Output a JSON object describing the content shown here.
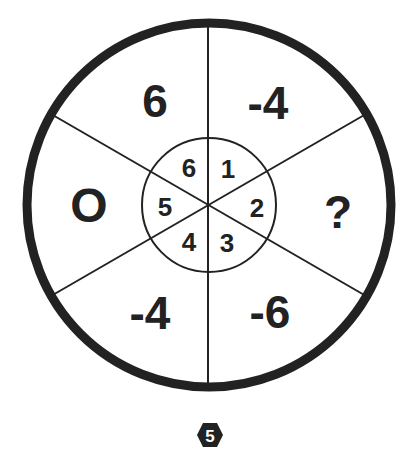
{
  "puzzle": {
    "outer_sectors": [
      {
        "position": "top-left",
        "value": "6"
      },
      {
        "position": "top-right",
        "value": "-4"
      },
      {
        "position": "right",
        "value": "?"
      },
      {
        "position": "bottom-right",
        "value": "-6"
      },
      {
        "position": "bottom-left",
        "value": "-4"
      },
      {
        "position": "left",
        "value": "O"
      }
    ],
    "inner_sectors": [
      {
        "position": "top-right",
        "value": "1"
      },
      {
        "position": "right",
        "value": "2"
      },
      {
        "position": "bottom-right",
        "value": "3"
      },
      {
        "position": "bottom-left",
        "value": "4"
      },
      {
        "position": "left",
        "value": "5"
      },
      {
        "position": "top-left",
        "value": "6"
      }
    ]
  },
  "badge": {
    "shape": "hexagon",
    "label": "5"
  },
  "colors": {
    "ink": "#222222",
    "background": "#ffffff",
    "badge_fill": "#222222",
    "badge_text": "#ffffff"
  }
}
